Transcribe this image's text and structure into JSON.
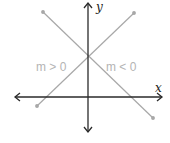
{
  "diagram": {
    "axes": {
      "x_label": "x",
      "y_label": "y",
      "axis_color": "#2a2a2a"
    },
    "lines": [
      {
        "name": "positive-slope",
        "label": "m > 0",
        "color": "#a8a8a8"
      },
      {
        "name": "negative-slope",
        "label": "m < 0",
        "color": "#a8a8a8"
      }
    ]
  }
}
